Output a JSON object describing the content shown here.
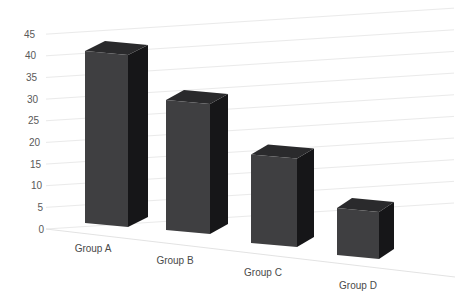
{
  "chart_data": {
    "type": "bar",
    "style": "3d-column",
    "title": "",
    "xlabel": "",
    "ylabel": "",
    "categories": [
      "Group A",
      "Group B",
      "Group C",
      "Group D"
    ],
    "values": [
      40,
      30,
      20,
      10
    ],
    "series": [
      {
        "name": "Series 1",
        "values": [
          40,
          30,
          20,
          10
        ]
      }
    ],
    "ylim": [
      0,
      45
    ],
    "y_ticks": [
      0,
      5,
      10,
      15,
      20,
      25,
      30,
      35,
      40,
      45
    ],
    "grid": true,
    "legend": false,
    "legend_position": "none"
  },
  "colors": {
    "background": "#ffffff",
    "bar_front": "#3f3f41",
    "bar_top": "#2a2a2c",
    "bar_side": "#161618",
    "gridline": "#eaeaea",
    "floor_edge": "#e3e3e3",
    "tick_label": "#595959",
    "category_label": "#4a4a4a"
  }
}
